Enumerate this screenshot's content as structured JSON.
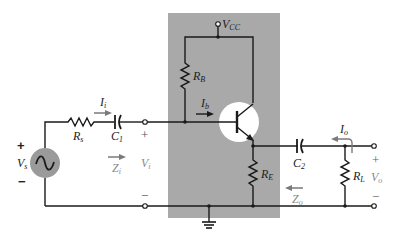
{
  "diagram": {
    "type": "emitter-follower amplifier schematic",
    "colors": {
      "network_box": "#a9a9a9",
      "transistor_bg": "#ffffff",
      "source_fill": "#9a9a9a",
      "wire": "#1a1a1a",
      "arrow_grey": "#7a7a7a"
    },
    "labels": {
      "vcc": {
        "main": "V",
        "sub": "CC"
      },
      "rb": {
        "main": "R",
        "sub": "B"
      },
      "ib": {
        "main": "I",
        "sub": "b"
      },
      "rs": {
        "main": "R",
        "sub": "s"
      },
      "ii": {
        "main": "I",
        "sub": "i"
      },
      "c1": {
        "main": "C",
        "sub": "1"
      },
      "vs": {
        "main": "V",
        "sub": "s"
      },
      "vs_plus": "+",
      "vs_minus": "−",
      "zi": {
        "main": "Z",
        "sub": "i"
      },
      "vi": {
        "main": "V",
        "sub": "i"
      },
      "vi_plus": "+",
      "vi_minus": "−",
      "re": {
        "main": "R",
        "sub": "E"
      },
      "c2": {
        "main": "C",
        "sub": "2"
      },
      "zo": {
        "main": "Z",
        "sub": "o"
      },
      "io": {
        "main": "I",
        "sub": "o"
      },
      "rl": {
        "main": "R",
        "sub": "L"
      },
      "vo": {
        "main": "V",
        "sub": "o"
      },
      "vo_plus": "+",
      "vo_minus": "−"
    }
  }
}
